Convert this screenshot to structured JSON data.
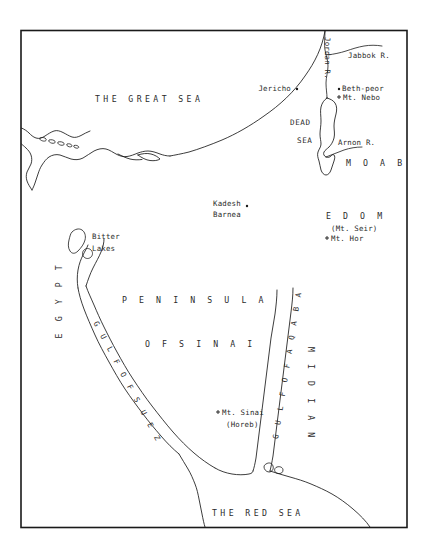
{
  "map": {
    "title": "Map of the Sinai Peninsula and Exodus Region",
    "frame_color": "#1a1a1a",
    "ink_color": "#2b2b2b",
    "background_color": "#ffffff",
    "seas": [
      {
        "id": "great-sea",
        "label": "THE  GREAT  SEA"
      },
      {
        "id": "red-sea",
        "label": "THE  RED  SEA"
      },
      {
        "id": "dead-sea-1",
        "label": "DEAD"
      },
      {
        "id": "dead-sea-2",
        "label": "SEA"
      }
    ],
    "regions": [
      {
        "id": "moab",
        "label": "M  O  A  B"
      },
      {
        "id": "edom",
        "label": "E  D  O  M"
      },
      {
        "id": "peninsula",
        "label": "P E N I N S U L A"
      },
      {
        "id": "of-sinai",
        "label": "O F   S I N A I"
      },
      {
        "id": "egypt",
        "label": "E G Y P T"
      },
      {
        "id": "midian",
        "label": "M I D I A N"
      }
    ],
    "gulfs": [
      {
        "id": "gulf-of-suez",
        "label": "G U L F   O F   S U E Z"
      },
      {
        "id": "gulf-of-aqaba",
        "label": "G U L F   O F   A Q A B A"
      }
    ],
    "rivers": [
      {
        "id": "jordan-river",
        "label": "Jordan R."
      },
      {
        "id": "jabbok-river",
        "label": "Jabbok R."
      },
      {
        "id": "arnon-river",
        "label": "Arnon R."
      }
    ],
    "places": [
      {
        "id": "jericho",
        "label": "Jericho",
        "marker": "dot"
      },
      {
        "id": "beth-peor",
        "label": "Beth-peor",
        "marker": "dot"
      },
      {
        "id": "mt-nebo",
        "label": "Mt. Nebo",
        "marker": "cross"
      },
      {
        "id": "mt-seir",
        "label": "(Mt. Seir)",
        "marker": "none"
      },
      {
        "id": "mt-hor",
        "label": "Mt. Hor",
        "marker": "cross"
      },
      {
        "id": "kadesh",
        "label": "Kadesh",
        "marker": "dot"
      },
      {
        "id": "barnea",
        "label": "Barnea",
        "marker": "none"
      },
      {
        "id": "bitter-lakes1",
        "label": "Bitter",
        "marker": "none"
      },
      {
        "id": "bitter-lakes2",
        "label": "Lakes",
        "marker": "none"
      },
      {
        "id": "mt-sinai",
        "label": "Mt. Sinai",
        "marker": "cross"
      },
      {
        "id": "horeb",
        "label": "(Horeb)",
        "marker": "none"
      }
    ]
  }
}
